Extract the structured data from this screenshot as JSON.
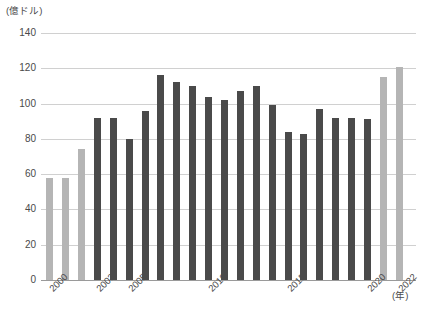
{
  "chart_data": {
    "type": "bar",
    "title": "",
    "subtitle": "",
    "xlabel": "(年)",
    "ylabel": "(億ドル)",
    "ylim": [
      0,
      140
    ],
    "ytick_step": 20,
    "yticks": [
      0,
      20,
      40,
      60,
      80,
      100,
      120,
      140
    ],
    "ytick_labels": [
      "0",
      "20",
      "40",
      "60",
      "80",
      "100",
      "120",
      "140"
    ],
    "grid": true,
    "legend": "none",
    "categories": [
      "2000",
      "2001",
      "2002",
      "2003",
      "2004",
      "2005",
      "2006",
      "2007",
      "2008",
      "2009",
      "2010",
      "2011",
      "2012",
      "2013",
      "2014",
      "2015",
      "2016",
      "2017",
      "2018",
      "2019",
      "2020",
      "2021",
      "2022"
    ],
    "values": [
      58,
      58,
      74,
      92,
      92,
      80,
      96,
      116,
      112,
      110,
      104,
      102,
      107,
      110,
      99,
      84,
      83,
      97,
      92,
      92,
      91,
      115,
      121
    ],
    "bar_colors": [
      "#b5b5b5",
      "#b5b5b5",
      "#b5b5b5",
      "#4a4a4a",
      "#4a4a4a",
      "#4a4a4a",
      "#4a4a4a",
      "#4a4a4a",
      "#4a4a4a",
      "#4a4a4a",
      "#4a4a4a",
      "#4a4a4a",
      "#4a4a4a",
      "#4a4a4a",
      "#4a4a4a",
      "#4a4a4a",
      "#4a4a4a",
      "#4a4a4a",
      "#4a4a4a",
      "#4a4a4a",
      "#4a4a4a",
      "#b5b5b5",
      "#b5b5b5"
    ],
    "xtick_labels_shown": [
      "2000",
      "2003",
      "2005",
      "2010",
      "2015",
      "2020",
      "2022"
    ],
    "colors": {
      "bar_light": "#b5b5b5",
      "bar_dark": "#4a4a4a",
      "grid": "#d0d0d0",
      "axis": "#9a9a9a",
      "text": "#4a4a4a"
    }
  }
}
